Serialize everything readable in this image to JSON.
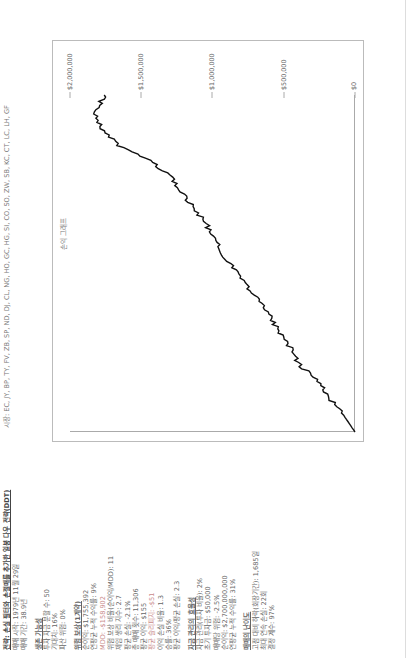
{
  "strategy": {
    "title": "전략: 손실 필터와 손절매를 추가한 일봉 다우 전략(DDT)",
    "trade_start": "매매 시작: 1979년 11월 29일",
    "trade_period": "매매 기간: 38.9년"
  },
  "markets": "시장: EC, JY, BP, TY, FV, ZB, SP, ND, DJ, CL, NG, HO, GC, HG, SI, CO, SO, ZW, SB, KC, CT, LC, LH, GF",
  "sections": [
    {
      "heading": "생존 가능성",
      "lines": [
        "투자 자금 분할 수: 50",
        "기대치: 16%",
        "파산 위험: 0%"
      ]
    },
    {
      "heading": "위험 보상(1계약)",
      "lines": [
        "순이익: $1,755,392",
        "연평균 누적 수익률: 9%",
        "MDD: -$158,902",
        "위험 보상 비율(순이익/MDD): 11",
        "제임 생리 지수: 2.7",
        "평균 손실: -2.1%",
        "총 매매 횟수: 11,306",
        "평균 이익: $155",
        "평균 슬리피지: -$51",
        "이익 손실 비율: 1.3",
        "승률: 36%",
        "평균 이익/평균 손실: 2.3"
      ]
    },
    {
      "heading": "자금 관리의 효율성",
      "lines": [
        "자금 관리(투자 비율): 2%",
        "초기 투자금: $50,000",
        "매매당 위험: -2.5%",
        "순이익: $2,700,000,000",
        "연평균 누적 수익률: 31%"
      ]
    },
    {
      "heading": "매매의 난이도",
      "lines": [
        "고점 대비 하락(회장기간): 1,685일",
        "최대 연속 손실: 22회",
        "결정 계수: 97%"
      ]
    }
  ],
  "chart_data": {
    "type": "line",
    "title": "손익 그래프",
    "xlabel": "",
    "ylabel": "",
    "ylim": [
      0,
      2000000
    ],
    "yticks": [
      "$0",
      "$500,000",
      "$1,000,000",
      "$1,500,000",
      "$2,000,000"
    ],
    "grid": false,
    "legend": null,
    "x": [
      0,
      5,
      10,
      15,
      20,
      25,
      30,
      35,
      40,
      45,
      50,
      55,
      60,
      65,
      70,
      75,
      80,
      85,
      90,
      95,
      100
    ],
    "series": [
      {
        "name": "누적 순이익",
        "values": [
          0,
          80000,
          180000,
          260000,
          390000,
          450000,
          540000,
          600000,
          700000,
          780000,
          880000,
          960000,
          1020000,
          1100000,
          1200000,
          1280000,
          1420000,
          1660000,
          1790000,
          1820000,
          1760000
        ]
      }
    ]
  }
}
